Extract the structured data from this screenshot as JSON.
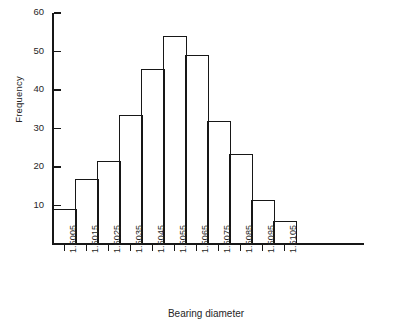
{
  "chart_data": {
    "type": "bar",
    "title": "",
    "subtitle": "",
    "xlabel": "Bearing diameter",
    "ylabel": "Frequency",
    "grid": false,
    "legend": null,
    "orientation": "vertical",
    "bar_style": "histogram-outline",
    "categories": [
      "1.5005",
      "1.5015",
      "1.5025",
      "1.5035",
      "1.5045",
      "1.5055",
      "1.5065",
      "1.5075",
      "1.5085",
      "1.5095",
      "1.5105"
    ],
    "values": [
      9,
      17,
      21.5,
      33.5,
      45.5,
      54,
      49,
      32,
      23.5,
      11.5,
      6
    ],
    "ylim": [
      0,
      60
    ],
    "yticks": [
      10,
      20,
      30,
      40,
      50,
      60
    ],
    "ytick_labels": [
      "10",
      "20",
      "30",
      "40",
      "50",
      "60"
    ],
    "xtick_labels": [
      "1.5005",
      "1.5015",
      "1.5025",
      "1.5035",
      "1.5045",
      "1.5055",
      "1.5065",
      "1.5075",
      "1.5085",
      "1.5095",
      "1.5105"
    ],
    "bin_count": 11,
    "colors": {
      "axis": "#171717",
      "bar_edge": "#171717",
      "bar_fill": "none",
      "text": "#262626",
      "background": "#ffffff"
    }
  }
}
